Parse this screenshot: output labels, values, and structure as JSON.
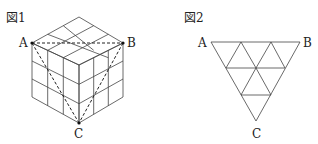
{
  "figure1": {
    "caption": "図1",
    "points": {
      "A": "A",
      "B": "B",
      "C": "C"
    },
    "description": "3x3x3 cube with dashed triangle ABC"
  },
  "figure2": {
    "caption": "図2",
    "points": {
      "A": "A",
      "B": "B",
      "C": "C"
    },
    "description": "Inverted triangle subdivided into small triangles"
  }
}
